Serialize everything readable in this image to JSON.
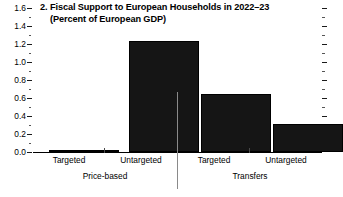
{
  "chart_data": {
    "type": "bar",
    "title": "2. Fiscal Support to European Households in 2022–23",
    "subtitle": "(Percent of European GDP)",
    "xlabel": "",
    "ylabel": "",
    "ylim": [
      0.0,
      1.6
    ],
    "ytick_step": 0.2,
    "yticks": [
      "0.0",
      "0.2",
      "0.4",
      "0.6",
      "0.8",
      "1.0",
      "1.2",
      "1.4",
      "1.6"
    ],
    "ytick_values": [
      0.0,
      0.2,
      0.4,
      0.6,
      0.8,
      1.0,
      1.2,
      1.4,
      1.6
    ],
    "minor_ticks": true,
    "grid": false,
    "legend": null,
    "bar_color": "#151515",
    "groups": [
      {
        "name": "Price-based",
        "categories": [
          "Targeted",
          "Untargeted"
        ],
        "values": [
          0.02,
          1.23
        ]
      },
      {
        "name": "Transfers",
        "categories": [
          "Targeted",
          "Untargeted"
        ],
        "values": [
          0.65,
          0.31
        ]
      }
    ],
    "categories": [
      "Targeted",
      "Untargeted",
      "Targeted",
      "Untargeted"
    ],
    "values": [
      0.02,
      1.23,
      0.65,
      0.31
    ]
  }
}
